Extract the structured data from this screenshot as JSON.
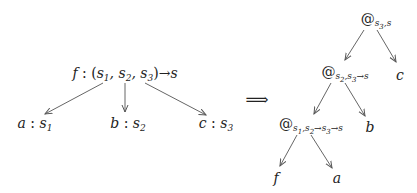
{
  "left_tree": {
    "root": {
      "text": "f : (s1, s2, s3)→s"
    },
    "children": [
      {
        "text": "a : s1"
      },
      {
        "text": "b : s2"
      },
      {
        "text": "c : s3"
      }
    ]
  },
  "transform_symbol": "⟹",
  "right_tree": {
    "root": {
      "text": "@ s3,s"
    },
    "nodes": [
      {
        "id": "app2",
        "text": "@ s2,s3→s"
      },
      {
        "id": "c",
        "text": "c"
      },
      {
        "id": "app1",
        "text": "@ s1,s2→s3→s"
      },
      {
        "id": "b",
        "text": "b"
      },
      {
        "id": "f",
        "text": "f"
      },
      {
        "id": "a",
        "text": "a"
      }
    ]
  },
  "colors": {
    "line": "#555555",
    "text": "#222222"
  }
}
